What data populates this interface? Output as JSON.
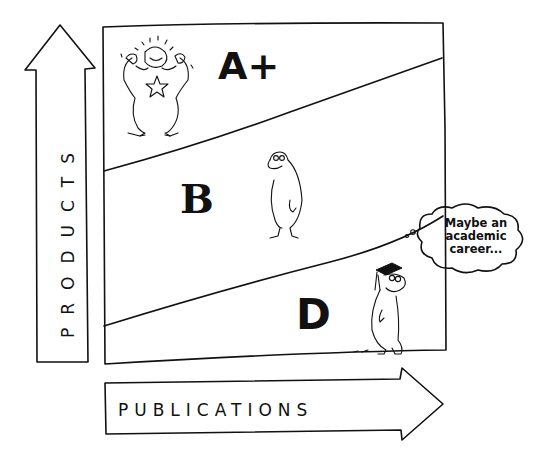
{
  "diagram": {
    "y_axis": {
      "label": "PRODUCTS",
      "direction": "up"
    },
    "x_axis": {
      "label": "PUBLICATIONS",
      "direction": "right"
    },
    "regions": [
      {
        "grade": "A+",
        "position": "top",
        "figure": "flexing-happy-character-with-star"
      },
      {
        "grade": "B",
        "position": "middle",
        "figure": "neutral-character"
      },
      {
        "grade": "D",
        "position": "bottom",
        "figure": "worried-character-with-graduation-cap"
      }
    ],
    "thought_bubble": {
      "lines": [
        "Maybe an",
        "academic",
        "career..."
      ]
    },
    "colors": {
      "ink": "#111111",
      "background": "#ffffff"
    }
  }
}
